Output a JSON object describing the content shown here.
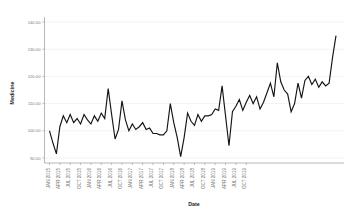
{
  "chart_data": {
    "type": "line",
    "title": "",
    "xlabel": "Date",
    "ylabel": "Medicine",
    "ylim": [
      90.0,
      140.0
    ],
    "yticks": [
      90.0,
      100.0,
      110.0,
      120.0,
      130.0,
      140.0
    ],
    "ytick_labels": [
      "90.00",
      "100.00",
      "110.00",
      "120.00",
      "130.00",
      "140.00"
    ],
    "grid": true,
    "legend": "none",
    "x_tick_labels": [
      "JAN 2015",
      "APR 2015",
      "JUL 2015",
      "OCT 2015",
      "JAN 2016",
      "APR 2016",
      "JUL 2016",
      "OCT 2016",
      "JAN 2017",
      "APR 2017",
      "JUL 2017",
      "OCT 2017",
      "JAN 2018",
      "APR 2018",
      "JUL 2018",
      "OCT 2018",
      "JAN 2019",
      "APR 2019",
      "JUL 2019",
      "OCT 2019"
    ],
    "x": [
      "JAN 2015",
      "FEB 2015",
      "MAR 2015",
      "APR 2015",
      "MAY 2015",
      "JUN 2015",
      "JUL 2015",
      "AUG 2015",
      "SEP 2015",
      "OCT 2015",
      "NOV 2015",
      "DEC 2015",
      "JAN 2016",
      "FEB 2016",
      "MAR 2016",
      "APR 2016",
      "MAY 2016",
      "JUN 2016",
      "JUL 2016",
      "AUG 2016",
      "SEP 2016",
      "OCT 2016",
      "NOV 2016",
      "DEC 2016",
      "JAN 2017",
      "FEB 2017",
      "MAR 2017",
      "APR 2017",
      "MAY 2017",
      "JUN 2017",
      "JUL 2017",
      "AUG 2017",
      "SEP 2017",
      "OCT 2017",
      "NOV 2017",
      "DEC 2017",
      "JAN 2018",
      "FEB 2018",
      "MAR 2018",
      "APR 2018",
      "MAY 2018",
      "JUN 2018",
      "JUL 2018",
      "AUG 2018",
      "SEP 2018",
      "OCT 2018",
      "NOV 2018",
      "DEC 2018",
      "JAN 2019",
      "FEB 2019",
      "MAR 2019",
      "APR 2019",
      "MAY 2019",
      "JUN 2019",
      "JUL 2019",
      "AUG 2019",
      "SEP 2019",
      "OCT 2019",
      "NOV 2019",
      "DEC 2019"
    ],
    "values": [
      100.0,
      95.5,
      91.5,
      101.5,
      105.5,
      103.0,
      106.0,
      103.0,
      104.5,
      102.5,
      106.0,
      104.0,
      102.5,
      105.5,
      103.5,
      106.5,
      104.5,
      115.5,
      106.0,
      97.0,
      100.5,
      111.0,
      104.0,
      100.0,
      102.5,
      100.5,
      101.5,
      103.0,
      100.5,
      101.0,
      99.0,
      99.0,
      98.5,
      98.5,
      100.0,
      110.0,
      103.0,
      97.5,
      90.5,
      97.5,
      106.5,
      103.5,
      102.0,
      106.0,
      103.5,
      105.5,
      105.5,
      106.0,
      108.0,
      107.5,
      116.5,
      105.5,
      94.5,
      107.0,
      109.0,
      111.5,
      107.5,
      110.5,
      113.0,
      110.0
    ],
    "values2": [
      112.5,
      108.0,
      110.5,
      114.0,
      117.5,
      112.5,
      125.0,
      118.0,
      115.0,
      113.5,
      107.0,
      110.0,
      117.5,
      112.0,
      118.5,
      120.0,
      117.0,
      119.0,
      116.0,
      118.0,
      116.5,
      117.5,
      127.0,
      135.0
    ]
  },
  "axis_titles": {
    "y": "Medicine",
    "x": "Date"
  }
}
